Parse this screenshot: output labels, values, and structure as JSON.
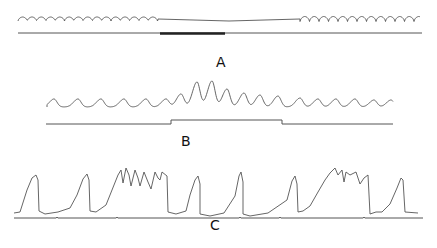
{
  "figure": {
    "panels": [
      {
        "id": "A",
        "label": "A",
        "label_pos": [
          221,
          68
        ],
        "trace": {
          "segments": [
            {
              "type": "ripple",
              "x0": 18,
              "x1": 158,
              "base": 19,
              "amp": 4,
              "period": 9.3
            },
            {
              "type": "flat",
              "x0": 158,
              "x1": 300,
              "y0": 19,
              "y1": 21
            },
            {
              "type": "ripple",
              "x0": 300,
              "x1": 420,
              "base": 19,
              "amp": 5,
              "period": 9.5
            }
          ]
        },
        "marker": {
          "y": 33,
          "x0": 18,
          "x1": 422,
          "thick_x0": 160,
          "thick_x1": 225
        }
      },
      {
        "id": "B",
        "label": "B",
        "label_pos": [
          186,
          147
        ],
        "trace": {
          "peaks": [
            {
              "x": 54,
              "h": 8
            },
            {
              "x": 78,
              "h": 8
            },
            {
              "x": 101,
              "h": 8
            },
            {
              "x": 124,
              "h": 8
            },
            {
              "x": 146,
              "h": 8
            },
            {
              "x": 166,
              "h": 8
            },
            {
              "x": 181,
              "h": 13
            },
            {
              "x": 197,
              "h": 25
            },
            {
              "x": 212,
              "h": 26
            },
            {
              "x": 227,
              "h": 18
            },
            {
              "x": 244,
              "h": 14
            },
            {
              "x": 260,
              "h": 12
            },
            {
              "x": 278,
              "h": 11
            },
            {
              "x": 300,
              "h": 9
            },
            {
              "x": 318,
              "h": 8
            },
            {
              "x": 336,
              "h": 8
            },
            {
              "x": 355,
              "h": 8
            },
            {
              "x": 374,
              "h": 7
            },
            {
              "x": 391,
              "h": 7
            }
          ],
          "x0": 47,
          "x1": 393,
          "base": 107
        },
        "marker": {
          "x0": 46,
          "x1": 393,
          "y_low": 124,
          "y_high": 120,
          "step_up_x": 171,
          "step_down_x": 282
        }
      },
      {
        "id": "C",
        "label": "C",
        "label_pos": [
          215,
          231
        ],
        "trace": {
          "points": [
            [
              14,
              213
            ],
            [
              20,
              212
            ],
            [
              27,
              190
            ],
            [
              32,
              178
            ],
            [
              36,
              175
            ],
            [
              38,
              180
            ],
            [
              39,
              211
            ],
            [
              45,
              214
            ],
            [
              58,
              212
            ],
            [
              70,
              208
            ],
            [
              77,
              195
            ],
            [
              83,
              179
            ],
            [
              87,
              174
            ],
            [
              89,
              180
            ],
            [
              90,
              211
            ],
            [
              96,
              212
            ],
            [
              106,
              205
            ],
            [
              112,
              190
            ],
            [
              118,
              175
            ],
            [
              121,
              170
            ],
            [
              123,
              183
            ],
            [
              126,
              168
            ],
            [
              129,
              175
            ],
            [
              131,
              186
            ],
            [
              135,
              170
            ],
            [
              138,
              178
            ],
            [
              140,
              186
            ],
            [
              144,
              172
            ],
            [
              148,
              182
            ],
            [
              151,
              189
            ],
            [
              155,
              172
            ],
            [
              158,
              178
            ],
            [
              160,
              180
            ],
            [
              162,
              172
            ],
            [
              167,
              176
            ],
            [
              168,
              212
            ],
            [
              176,
              214
            ],
            [
              186,
              211
            ],
            [
              190,
              195
            ],
            [
              195,
              180
            ],
            [
              198,
              176
            ],
            [
              200,
              184
            ],
            [
              200,
              214
            ],
            [
              210,
              216
            ],
            [
              224,
              213
            ],
            [
              235,
              196
            ],
            [
              239,
              176
            ],
            [
              241,
              172
            ],
            [
              243,
              182
            ],
            [
              243,
              214
            ],
            [
              250,
              216
            ],
            [
              268,
              213
            ],
            [
              287,
              200
            ],
            [
              292,
              181
            ],
            [
              295,
              176
            ],
            [
              297,
              184
            ],
            [
              298,
              212
            ],
            [
              303,
              211
            ],
            [
              310,
              206
            ],
            [
              318,
              192
            ],
            [
              325,
              180
            ],
            [
              330,
              173
            ],
            [
              335,
              168
            ],
            [
              338,
              175
            ],
            [
              342,
              170
            ],
            [
              344,
              182
            ],
            [
              346,
              172
            ],
            [
              350,
              175
            ],
            [
              356,
              172
            ],
            [
              360,
              184
            ],
            [
              364,
              178
            ],
            [
              368,
              175
            ],
            [
              370,
              214
            ],
            [
              376,
              212
            ],
            [
              382,
              212
            ],
            [
              390,
              204
            ],
            [
              397,
              188
            ],
            [
              401,
              178
            ],
            [
              403,
              180
            ],
            [
              405,
              212
            ],
            [
              418,
              213
            ]
          ]
        },
        "marker": {
          "x0": 14,
          "x1": 423,
          "y": 218,
          "notches": [
            56,
            116,
            239,
            279,
            363
          ]
        }
      }
    ]
  }
}
